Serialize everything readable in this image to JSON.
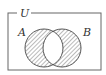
{
  "diagram": {
    "type": "venn",
    "universe_label": "U",
    "sets": [
      {
        "label": "A"
      },
      {
        "label": "B"
      }
    ],
    "shaded_regions": [
      "A only",
      "B only"
    ],
    "unshaded_regions": [
      "A ∩ B",
      "outside A ∪ B"
    ],
    "colors": {
      "line": "#555555",
      "hatch": "#777777",
      "background": "#ffffff"
    }
  }
}
